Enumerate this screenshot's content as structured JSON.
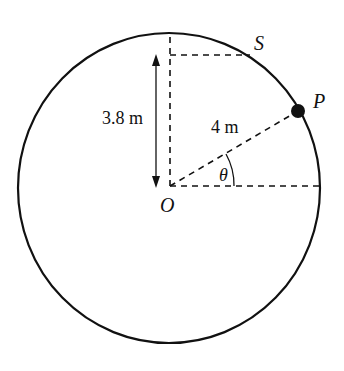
{
  "diagram": {
    "labels": {
      "S": "S",
      "P": "P",
      "O": "O",
      "theta": "θ",
      "radius": "4 m",
      "height": "3.8 m"
    },
    "geometry": {
      "center": [
        170,
        187
      ],
      "radius_x": 151,
      "radius_y": 155,
      "point_P": [
        298,
        111
      ],
      "point_S": [
        250,
        55
      ]
    },
    "colors": {
      "stroke": "#111111",
      "background": "#ffffff"
    }
  }
}
